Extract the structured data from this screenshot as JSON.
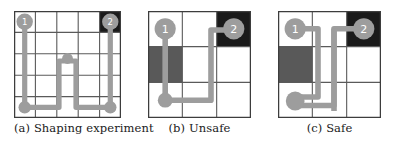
{
  "figure": {
    "type": "diagram",
    "colors": {
      "path": "#9d9d9d",
      "node": "#9d9d9d",
      "grid_line": "#5a5a5a",
      "cell_background": "#ffffff",
      "goal_cell": "#1a1a1a",
      "hazard_cell": "#595959",
      "node_label": "#ffffff",
      "caption_text": "#1a1a1a"
    },
    "panels": [
      {
        "id": "a",
        "caption": "(a) Shaping experiment",
        "grid": {
          "cols": 5,
          "rows": 5
        },
        "goal_cell": {
          "col": 4,
          "row": 0,
          "fill": "goal_cell"
        },
        "hazard_cells": [],
        "nodes": [
          {
            "label": "1",
            "col": 0,
            "row": 0
          },
          {
            "label": "2",
            "col": 4,
            "row": 0
          },
          {
            "label": "",
            "col": 0,
            "row": 4
          },
          {
            "label": "",
            "col": 4,
            "row": 4
          },
          {
            "label": "",
            "col": 2,
            "row": 2
          }
        ],
        "path": "M 0,0 L 0,4 L 1.6,4 L 1.6,2 L 2.4,2 L 2.4,4 L 4,4 L 4,0"
      },
      {
        "id": "b",
        "caption": "(b) Unsafe",
        "grid": {
          "cols": 3,
          "rows": 3
        },
        "goal_cell": {
          "col": 2,
          "row": 0,
          "fill": "goal_cell"
        },
        "hazard_cells": [
          {
            "col": 0,
            "row": 1,
            "fill": "hazard_cell"
          }
        ],
        "nodes": [
          {
            "label": "1",
            "col": 0,
            "row": 0
          },
          {
            "label": "2",
            "col": 2,
            "row": 0
          },
          {
            "label": "",
            "col": 0,
            "row": 2
          }
        ],
        "path": "M 0,0 L 0,2 L 1.35,2 L 1.35,0.35 L 2,0.35 L 2,0"
      },
      {
        "id": "c",
        "caption": "(c) Safe",
        "grid": {
          "cols": 3,
          "rows": 3
        },
        "goal_cell": {
          "col": 2,
          "row": 0,
          "fill": "goal_cell"
        },
        "hazard_cells": [
          {
            "col": 0,
            "row": 1,
            "fill": "hazard_cell"
          }
        ],
        "nodes": [
          {
            "label": "1",
            "col": 0,
            "row": 0
          },
          {
            "label": "2",
            "col": 2,
            "row": 0
          },
          {
            "label": "",
            "col": 0,
            "row": 2
          }
        ],
        "path_out": "M 0,0 L 0.75,0 L 0.75,1.75 L 0,1.75 L 0,2 L 1.1,2 L 1.1,0 L 2,0",
        "path_return": "M 1.38,0 L 1.38,2.25"
      }
    ]
  }
}
